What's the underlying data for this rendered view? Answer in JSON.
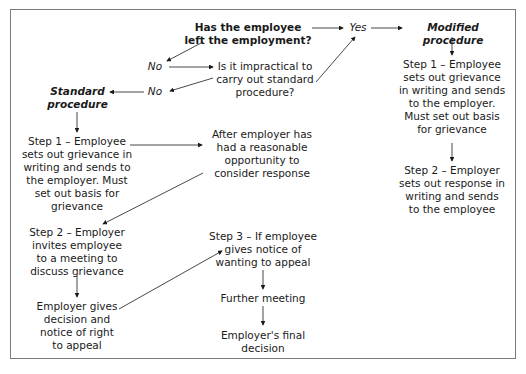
{
  "diagram": {
    "question1": "Has the employee\nleft the employment?",
    "yes_label": "Yes",
    "no_label_1": "No",
    "question2": "Is it impractical to\ncarry out standard\nprocedure?",
    "no_label_2": "No",
    "modified": {
      "title": "Modified procedure",
      "step1": "Step 1 – Employee\nsets out grievance\nin writing and sends\nto the employer.\nMust set out basis\nfor grievance",
      "step2": "Step 2 – Employer\nsets out response in\nwriting and sends\nto the employee"
    },
    "standard": {
      "title": "Standard\nprocedure",
      "step1": "Step 1 – Employee\nsets out grievance in\nwriting and sends to\nthe employer. Must\nset out basis for\ngrievance",
      "wait": "After employer has\nhad a reasonable\nopportunity to\nconsider response",
      "step2": "Step 2 – Employer\ninvites employee\nto a meeting to\ndiscuss grievance",
      "decision": "Employer gives\ndecision and\nnotice of right\nto appeal",
      "step3": "Step 3 – If employee\ngives notice of\nwanting to appeal",
      "further": "Further meeting",
      "final": "Employer's final\ndecision"
    }
  }
}
